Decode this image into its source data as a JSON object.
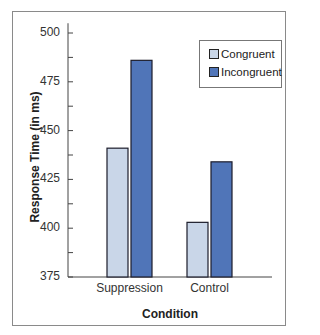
{
  "chart_data": {
    "type": "bar",
    "title": "",
    "xlabel": "Condition",
    "ylabel": "Response Time (in ms)",
    "categories": [
      "Suppression",
      "Control"
    ],
    "series": [
      {
        "name": "Congruent",
        "color": "#c9d6e8",
        "values": [
          441,
          403
        ]
      },
      {
        "name": "Incongruent",
        "color": "#5075b8",
        "values": [
          486,
          434
        ]
      }
    ],
    "ylim": [
      375,
      505
    ],
    "yticks": [
      375,
      400,
      425,
      450,
      475,
      500
    ],
    "minor_yticks": [
      387.5,
      412.5,
      437.5,
      462.5,
      487.5
    ],
    "grid": false,
    "legend_position": "upper right"
  },
  "labels": {
    "xlabel": "Condition",
    "ylabel": "Response Time (in ms)",
    "legend": [
      "Congruent",
      "Incongruent"
    ]
  }
}
